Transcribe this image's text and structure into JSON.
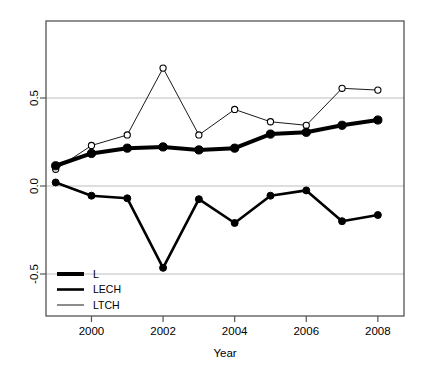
{
  "chart_data": {
    "type": "line",
    "title": "",
    "xlabel": "Year",
    "ylabel": "",
    "x": [
      1999,
      2000,
      2001,
      2002,
      2003,
      2004,
      2005,
      2006,
      2007,
      2008
    ],
    "xtick_labels": [
      "2000",
      "2002",
      "2004",
      "2006",
      "2008"
    ],
    "xtick_values": [
      2000,
      2002,
      2004,
      2006,
      2008
    ],
    "ytick_labels": [
      "0.5",
      "0.0",
      "-0.5"
    ],
    "ytick_values": [
      0.5,
      0.0,
      -0.5
    ],
    "xlim": [
      1998.73,
      2008.73
    ],
    "ylim": [
      -0.72,
      0.84
    ],
    "grid": "horizontal-gridlines-at-yticks",
    "legend_position": "bottom-left",
    "series": [
      {
        "name": "L",
        "style": "thick-solid-filled-circles",
        "linewidth": 4.0,
        "color": "#000000",
        "marker": "filled-circle",
        "values": [
          0.115,
          0.185,
          0.215,
          0.222,
          0.205,
          0.215,
          0.295,
          0.305,
          0.345,
          0.375
        ]
      },
      {
        "name": "LECH",
        "style": "medium-solid-filled-circles",
        "linewidth": 2.6,
        "color": "#000000",
        "marker": "filled-circle",
        "values": [
          0.02,
          -0.055,
          -0.07,
          -0.465,
          -0.075,
          -0.21,
          -0.055,
          -0.025,
          -0.2,
          -0.165
        ]
      },
      {
        "name": "LTCH",
        "style": "thin-solid-open-circles",
        "linewidth": 0.9,
        "color": "#000000",
        "marker": "open-circle",
        "values": [
          0.095,
          0.23,
          0.29,
          0.67,
          0.29,
          0.435,
          0.365,
          0.345,
          0.555,
          0.545
        ]
      }
    ]
  },
  "legend": {
    "entries": [
      {
        "label": "L"
      },
      {
        "label": "LECH"
      },
      {
        "label": "LTCH"
      }
    ]
  },
  "axes": {
    "x_axis_label": "Year",
    "x_ticks": [
      "2000",
      "2002",
      "2004",
      "2006",
      "2008"
    ],
    "y_ticks": [
      "0.5",
      "0.0",
      "-0.5"
    ]
  },
  "colors": {
    "foreground": "#000000",
    "background": "#ffffff",
    "gridline": "#b5b5b5",
    "box": "#555555"
  }
}
